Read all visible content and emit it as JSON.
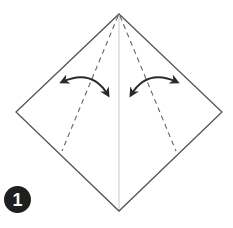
{
  "diagram": {
    "type": "origami-step",
    "step_number": "1",
    "shape": "square-diamond",
    "vertices": {
      "top": [
        119,
        14
      ],
      "left": [
        16,
        112
      ],
      "right": [
        222,
        112
      ],
      "bottom": [
        119,
        211
      ]
    },
    "center_crease": {
      "from": [
        119,
        14
      ],
      "to": [
        119,
        211
      ],
      "style": "solid-light"
    },
    "valley_folds": [
      {
        "name": "left-fold",
        "from": [
          119,
          14
        ],
        "to": [
          62,
          151
        ],
        "style": "dashed"
      },
      {
        "name": "right-fold",
        "from": [
          119,
          14
        ],
        "to": [
          176,
          151
        ],
        "style": "dashed"
      }
    ],
    "arrows": [
      {
        "name": "left-fold-arrow",
        "type": "fold-unfold",
        "start": [
          60,
          82
        ],
        "end": [
          110,
          97
        ]
      },
      {
        "name": "right-fold-arrow",
        "type": "fold-unfold",
        "start": [
          179,
          82
        ],
        "end": [
          130,
          97
        ]
      }
    ],
    "colors": {
      "outline": "#555555",
      "crease": "#c8c8c8",
      "dashed": "#666666",
      "arrow": "#2a2a2a",
      "badge": "#1f1f1f",
      "badge_text": "#ffffff"
    }
  }
}
